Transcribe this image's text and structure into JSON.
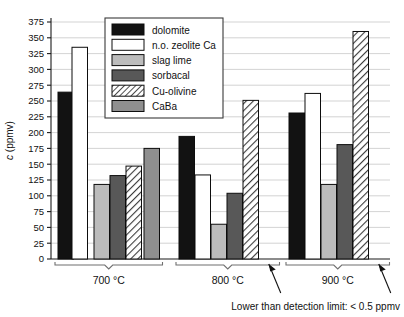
{
  "chart_data": {
    "type": "bar",
    "title": "",
    "subtitle": "",
    "xlabel": "",
    "ylabel": "c (ppmv)",
    "ylabel_italic_part": "c",
    "ylabel_rest": " (ppmv)",
    "ylim": [
      0,
      375
    ],
    "ytick_step": 25,
    "yticks": [
      0,
      25,
      50,
      75,
      100,
      125,
      150,
      175,
      200,
      225,
      250,
      275,
      300,
      325,
      350,
      375
    ],
    "ytick_labels": [
      "0",
      "25",
      "50",
      "75",
      "100",
      "125",
      "150",
      "175",
      "200",
      "225",
      "250",
      "275",
      "300",
      "325",
      "350",
      "375"
    ],
    "categories": [
      "700 °C",
      "800 °C",
      "900 °C"
    ],
    "grid": "horizontal",
    "legend_position": "top-center",
    "series": [
      {
        "name": "dolomite",
        "fill": "black",
        "values": [
          264,
          194,
          231
        ]
      },
      {
        "name": "n.o. zeolite Ca",
        "fill": "white",
        "values": [
          335,
          133,
          262
        ]
      },
      {
        "name": "slag lime",
        "fill": "light-gray",
        "values": [
          118,
          55,
          118
        ]
      },
      {
        "name": "sorbacal",
        "fill": "dark-gray",
        "values": [
          132,
          104,
          181
        ]
      },
      {
        "name": "Cu-olivine",
        "fill": "hatched",
        "values": [
          147,
          251,
          360
        ]
      },
      {
        "name": "CaBa",
        "fill": "mid-gray",
        "values": [
          175,
          null,
          null
        ]
      }
    ],
    "annotations": [
      {
        "text": "Lower than detection limit: < 0.5 ppmv",
        "points_to": [
          "800 °C CaBa",
          "900 °C CaBa"
        ]
      }
    ],
    "missing_note": "Lower than detection limit: < 0.5 ppmv"
  },
  "legend": {
    "entries": [
      {
        "label": "dolomite"
      },
      {
        "label": "n.o. zeolite Ca"
      },
      {
        "label": "slag lime"
      },
      {
        "label": "sorbacal"
      },
      {
        "label": "Cu-olivine"
      },
      {
        "label": "CaBa"
      }
    ]
  },
  "colors": {
    "black": "#121212",
    "white": "#ffffff",
    "light_gray": "#bcbcbc",
    "dark_gray": "#585858",
    "mid_gray": "#8f8f8f",
    "hatch_bg": "#ffffff",
    "hatch_line": "#3a3a3a",
    "grid": "#c8c8c8",
    "axis": "#1a1a1a",
    "brace": "#6f6f6f"
  },
  "axis": {
    "y_title": "c (ppmv)"
  },
  "groups": {
    "labels": [
      "700 °C",
      "800 °C",
      "900 °C"
    ]
  },
  "note": {
    "text": "Lower than detection limit: < 0.5 ppmv"
  }
}
